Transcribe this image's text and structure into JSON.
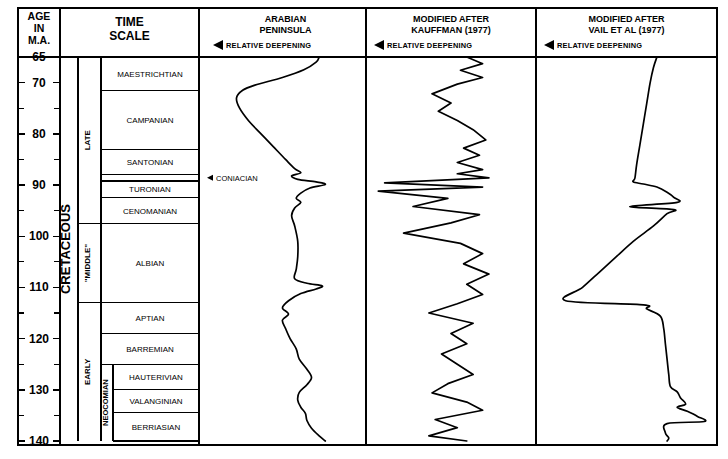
{
  "figure": {
    "kind": "geologic-time-scale-sea-level-curves",
    "background": "#ffffff",
    "line_color": "#000000"
  },
  "age_column": {
    "header_lines": [
      "AGE",
      "IN",
      "M.A."
    ],
    "unit": "M.A.",
    "major_labels": [
      65,
      70,
      80,
      90,
      100,
      110,
      120,
      130,
      140
    ],
    "minor_ticks": [
      75,
      85,
      95,
      105,
      115,
      125,
      135
    ],
    "axis_min": 65,
    "axis_max": 140
  },
  "time_scale": {
    "header_lines": [
      "TIME",
      "SCALE"
    ],
    "system": {
      "label": "CRETACEOUS",
      "top": 65,
      "bottom": 140
    },
    "series": [
      {
        "label": "LATE",
        "top": 65,
        "bottom": 97.5
      },
      {
        "label": "\"MIDDLE\"",
        "top": 97.5,
        "bottom": 113
      },
      {
        "label": "EARLY",
        "top": 113,
        "bottom": 140
      }
    ],
    "subseries": [
      {
        "label": "NEOCOMIAN",
        "top": 125,
        "bottom": 140
      }
    ],
    "stages": [
      {
        "label": "MAESTRICHTIAN",
        "top": 65,
        "bottom": 71.5
      },
      {
        "label": "CAMPANIAN",
        "top": 71.5,
        "bottom": 83
      },
      {
        "label": "SANTONIAN",
        "top": 83,
        "bottom": 88
      },
      {
        "label": "CONIACIAN",
        "top": 88,
        "bottom": 89.2,
        "label_outside": true
      },
      {
        "label": "TURONIAN",
        "top": 89.2,
        "bottom": 92.5
      },
      {
        "label": "CENOMANIAN",
        "top": 92.5,
        "bottom": 97.5
      },
      {
        "label": "ALBIAN",
        "top": 97.5,
        "bottom": 113
      },
      {
        "label": "APTIAN",
        "top": 113,
        "bottom": 119
      },
      {
        "label": "BARREMIAN",
        "top": 119,
        "bottom": 125
      },
      {
        "label": "HAUTERIVIAN",
        "top": 125,
        "bottom": 130
      },
      {
        "label": "VALANGINIAN",
        "top": 130,
        "bottom": 134.5
      },
      {
        "label": "BERRIASIAN",
        "top": 134.5,
        "bottom": 140
      }
    ],
    "coniacian_callout": "CONIACIAN"
  },
  "curve_panels": [
    {
      "id": "arabian-peninsula",
      "title_lines": [
        "ARABIAN",
        "PENINSULA"
      ],
      "axis_label": "RELATIVE DEEPENING",
      "axis_arrow": "left"
    },
    {
      "id": "kauffman-1977",
      "title_lines": [
        "MODIFIED AFTER",
        "KAUFFMAN (1977)"
      ],
      "axis_label": "RELATIVE DEEPENING",
      "axis_arrow": "left"
    },
    {
      "id": "vail-et-al-1977",
      "title_lines": [
        "MODIFIED AFTER",
        "VAIL ET AL (1977)"
      ],
      "axis_label": "RELATIVE DEEPENING",
      "axis_arrow": "left"
    }
  ],
  "chart_data": {
    "type": "line",
    "xlabel": "RELATIVE DEEPENING",
    "ylabel": "AGE IN M.A.",
    "ylim": [
      140,
      65
    ],
    "y_inverted": true,
    "grid": false,
    "legend": "none",
    "x_axis_note": "Deepening increases to the left (arrow points left); x values are relative, 0 = shallow (right) to 1 = deep (left)",
    "series": [
      {
        "name": "ARABIAN PENINSULA",
        "panel": "arabian-peninsula",
        "points": [
          [
            0.28,
            65.0
          ],
          [
            0.3,
            66.0
          ],
          [
            0.38,
            67.5
          ],
          [
            0.52,
            69.0
          ],
          [
            0.7,
            70.5
          ],
          [
            0.78,
            71.5
          ],
          [
            0.82,
            73.0
          ],
          [
            0.8,
            75.0
          ],
          [
            0.74,
            77.5
          ],
          [
            0.66,
            80.0
          ],
          [
            0.58,
            82.5
          ],
          [
            0.5,
            85.0
          ],
          [
            0.44,
            86.8
          ],
          [
            0.4,
            87.6
          ],
          [
            0.46,
            88.2
          ],
          [
            0.42,
            88.9
          ],
          [
            0.3,
            89.4
          ],
          [
            0.24,
            89.9
          ],
          [
            0.34,
            90.6
          ],
          [
            0.4,
            91.6
          ],
          [
            0.43,
            92.6
          ],
          [
            0.4,
            93.4
          ],
          [
            0.44,
            94.5
          ],
          [
            0.46,
            96.0
          ],
          [
            0.44,
            98.0
          ],
          [
            0.42,
            101.0
          ],
          [
            0.42,
            104.0
          ],
          [
            0.43,
            106.5
          ],
          [
            0.44,
            108.3
          ],
          [
            0.36,
            109.2
          ],
          [
            0.26,
            109.7
          ],
          [
            0.3,
            110.3
          ],
          [
            0.4,
            111.2
          ],
          [
            0.48,
            112.6
          ],
          [
            0.52,
            114.0
          ],
          [
            0.48,
            115.2
          ],
          [
            0.52,
            116.4
          ],
          [
            0.5,
            118.0
          ],
          [
            0.47,
            120.0
          ],
          [
            0.43,
            122.0
          ],
          [
            0.41,
            124.0
          ],
          [
            0.36,
            126.0
          ],
          [
            0.33,
            127.6
          ],
          [
            0.36,
            129.0
          ],
          [
            0.41,
            130.5
          ],
          [
            0.42,
            132.0
          ],
          [
            0.4,
            133.4
          ],
          [
            0.37,
            134.6
          ],
          [
            0.36,
            136.0
          ],
          [
            0.33,
            137.5
          ],
          [
            0.28,
            139.0
          ],
          [
            0.24,
            140.0
          ]
        ]
      },
      {
        "name": "MODIFIED AFTER KAUFFMAN (1977)",
        "panel": "kauffman-1977",
        "points": [
          [
            0.4,
            65.0
          ],
          [
            0.3,
            66.3
          ],
          [
            0.44,
            67.6
          ],
          [
            0.3,
            69.0
          ],
          [
            0.46,
            70.3
          ],
          [
            0.62,
            72.2
          ],
          [
            0.5,
            74.0
          ],
          [
            0.58,
            75.6
          ],
          [
            0.46,
            77.4
          ],
          [
            0.36,
            79.2
          ],
          [
            0.28,
            81.2
          ],
          [
            0.42,
            82.8
          ],
          [
            0.32,
            84.2
          ],
          [
            0.46,
            85.6
          ],
          [
            0.3,
            87.0
          ],
          [
            0.46,
            87.8
          ],
          [
            0.26,
            88.6
          ],
          [
            0.92,
            89.6
          ],
          [
            0.3,
            90.4
          ],
          [
            0.96,
            91.2
          ],
          [
            0.52,
            92.6
          ],
          [
            0.74,
            94.2
          ],
          [
            0.32,
            95.8
          ],
          [
            0.5,
            97.4
          ],
          [
            0.8,
            99.4
          ],
          [
            0.44,
            101.4
          ],
          [
            0.3,
            103.4
          ],
          [
            0.42,
            105.4
          ],
          [
            0.26,
            107.4
          ],
          [
            0.4,
            109.4
          ],
          [
            0.3,
            111.4
          ],
          [
            0.46,
            113.2
          ],
          [
            0.64,
            115.0
          ],
          [
            0.36,
            117.0
          ],
          [
            0.5,
            119.0
          ],
          [
            0.4,
            121.0
          ],
          [
            0.56,
            123.0
          ],
          [
            0.46,
            125.0
          ],
          [
            0.36,
            127.0
          ],
          [
            0.52,
            128.8
          ],
          [
            0.62,
            130.6
          ],
          [
            0.4,
            132.4
          ],
          [
            0.3,
            134.0
          ],
          [
            0.6,
            135.8
          ],
          [
            0.46,
            137.4
          ],
          [
            0.64,
            139.0
          ],
          [
            0.4,
            140.0
          ]
        ]
      },
      {
        "name": "MODIFIED AFTER VAIL ET AL (1977)",
        "panel": "vail-et-al-1977",
        "points": [
          [
            0.32,
            65.0
          ],
          [
            0.34,
            67.0
          ],
          [
            0.36,
            70.0
          ],
          [
            0.38,
            74.0
          ],
          [
            0.4,
            78.0
          ],
          [
            0.42,
            82.0
          ],
          [
            0.44,
            86.0
          ],
          [
            0.45,
            88.6
          ],
          [
            0.46,
            89.4
          ],
          [
            0.4,
            89.8
          ],
          [
            0.32,
            90.4
          ],
          [
            0.26,
            91.4
          ],
          [
            0.22,
            92.4
          ],
          [
            0.2,
            93.4
          ],
          [
            0.48,
            94.2
          ],
          [
            0.22,
            94.8
          ],
          [
            0.26,
            95.6
          ],
          [
            0.34,
            98.0
          ],
          [
            0.46,
            101.0
          ],
          [
            0.56,
            104.0
          ],
          [
            0.66,
            107.0
          ],
          [
            0.76,
            110.0
          ],
          [
            0.86,
            112.6
          ],
          [
            0.4,
            113.4
          ],
          [
            0.38,
            114.2
          ],
          [
            0.3,
            115.6
          ],
          [
            0.28,
            118.0
          ],
          [
            0.27,
            121.0
          ],
          [
            0.26,
            124.0
          ],
          [
            0.25,
            127.0
          ],
          [
            0.24,
            129.4
          ],
          [
            0.2,
            130.4
          ],
          [
            0.18,
            131.6
          ],
          [
            0.15,
            132.8
          ],
          [
            0.2,
            133.4
          ],
          [
            0.14,
            134.2
          ],
          [
            0.08,
            135.2
          ],
          [
            0.04,
            136.2
          ],
          [
            0.26,
            136.6
          ],
          [
            0.27,
            138.4
          ],
          [
            0.25,
            139.4
          ],
          [
            0.26,
            140.0
          ]
        ]
      }
    ]
  }
}
